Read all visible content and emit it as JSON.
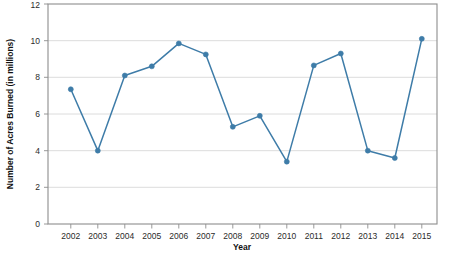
{
  "chart_data": {
    "type": "line",
    "title": "",
    "xlabel": "Year",
    "ylabel": "Number of Acres Burned (in millions)",
    "categories": [
      "2002",
      "2003",
      "2004",
      "2005",
      "2006",
      "2007",
      "2008",
      "2009",
      "2010",
      "2011",
      "2012",
      "2013",
      "2014",
      "2015"
    ],
    "values": [
      7.35,
      4.0,
      8.1,
      8.6,
      9.85,
      9.25,
      5.3,
      5.9,
      3.4,
      8.65,
      9.3,
      4.0,
      3.6,
      10.1
    ],
    "series": [
      {
        "name": "Number of Acres Burned (in millions)",
        "values": [
          7.35,
          4.0,
          8.1,
          8.6,
          9.85,
          9.25,
          5.3,
          5.9,
          3.4,
          8.65,
          9.3,
          4.0,
          3.6,
          10.1
        ]
      }
    ],
    "x_tick_labels": [
      "2002",
      "2003",
      "2004",
      "2005",
      "2006",
      "2007",
      "2008",
      "2009",
      "2010",
      "2011",
      "2012",
      "2013",
      "2014",
      "2015"
    ],
    "y_tick_labels": [
      "0",
      "2",
      "4",
      "6",
      "8",
      "10",
      "12"
    ],
    "y_ticks": [
      0,
      2,
      4,
      6,
      8,
      10,
      12
    ],
    "ylim": [
      0,
      12
    ],
    "grid": "horizontal",
    "legend": "none",
    "marker": "circle",
    "line_color": "#3e7ca8",
    "marker_color": "#3e7ca8",
    "grid_color": "#d8d8d8",
    "axis_color": "#8d8d8d",
    "background": "#ffffff"
  }
}
